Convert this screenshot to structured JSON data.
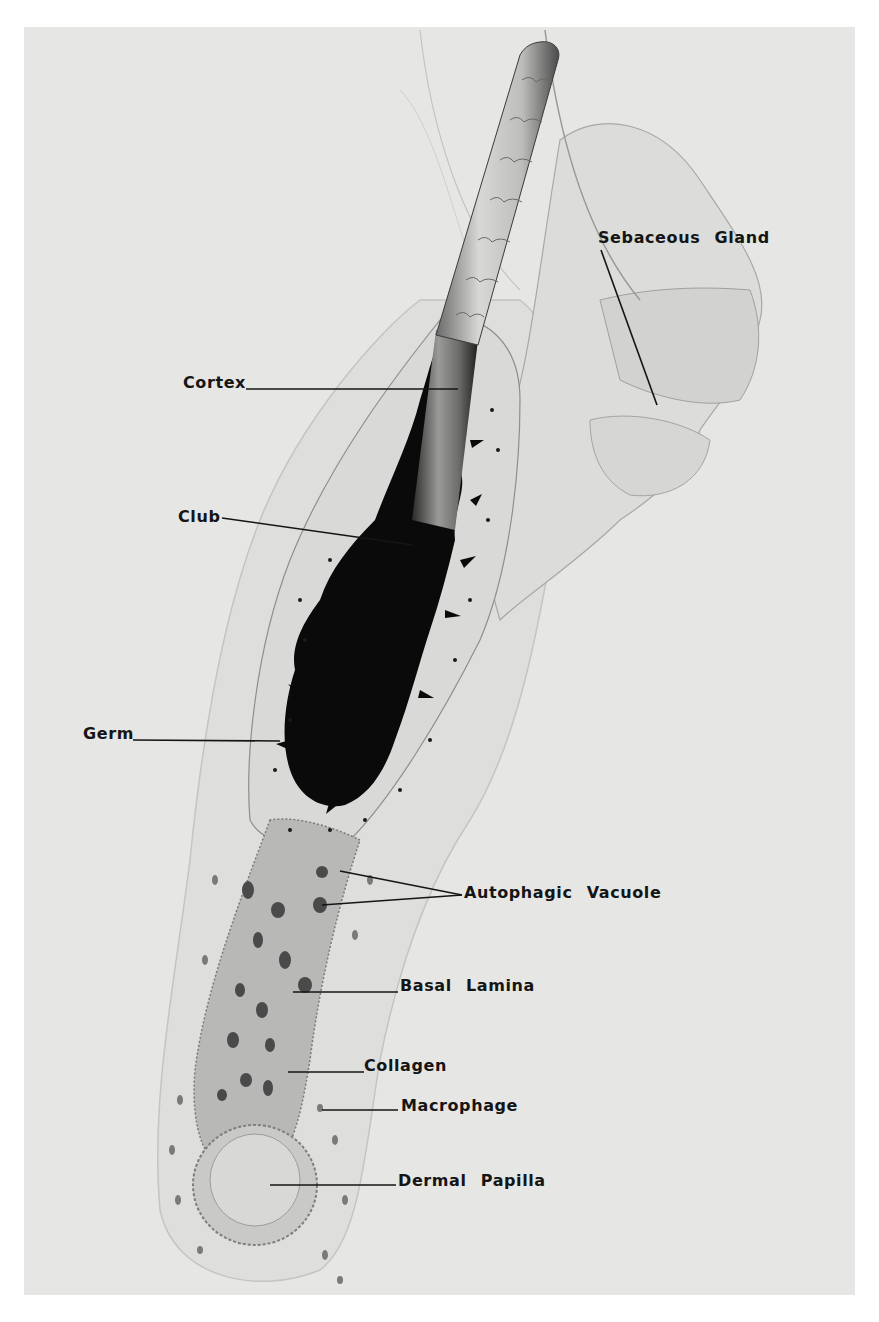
{
  "figure": {
    "background_color": "#e6e6e4",
    "page_color": "#ffffff",
    "labels": [
      {
        "id": "sebaceous-gland",
        "text": "Sebaceous Gland",
        "x": 598,
        "y": 229
      },
      {
        "id": "cortex",
        "text": "Cortex",
        "x": 183,
        "y": 374
      },
      {
        "id": "club",
        "text": "Club",
        "x": 178,
        "y": 508
      },
      {
        "id": "germ",
        "text": "Germ",
        "x": 83,
        "y": 732
      },
      {
        "id": "autophagic-vacuole",
        "text": "Autophagic Vacuole",
        "x": 464,
        "y": 884
      },
      {
        "id": "basal-lamina",
        "text": "Basal Lamina",
        "x": 400,
        "y": 977
      },
      {
        "id": "collagen",
        "text": "Collagen",
        "x": 364,
        "y": 1055
      },
      {
        "id": "macrophage",
        "text": "Macrophage",
        "x": 401,
        "y": 1097
      },
      {
        "id": "dermal-papilla",
        "text": "Dermal Papilla",
        "x": 398,
        "y": 1172
      }
    ]
  }
}
